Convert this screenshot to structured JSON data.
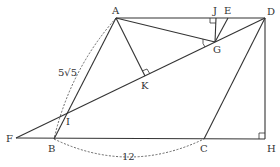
{
  "figure": {
    "type": "geometry",
    "points": {
      "A": {
        "label": "A",
        "x": 116,
        "y": 18
      },
      "D": {
        "label": "D",
        "x": 265,
        "y": 18
      },
      "J": {
        "label": "J",
        "x": 216,
        "y": 18
      },
      "E": {
        "label": "E",
        "x": 228,
        "y": 18
      },
      "G": {
        "label": "G",
        "x": 215,
        "y": 42
      },
      "K": {
        "label": "K",
        "x": 145,
        "y": 76
      },
      "I": {
        "label": "I",
        "x": 64,
        "y": 117
      },
      "F": {
        "label": "F",
        "x": 16,
        "y": 138
      },
      "B": {
        "label": "B",
        "x": 54,
        "y": 139
      },
      "C": {
        "label": "C",
        "x": 204,
        "y": 139
      },
      "H": {
        "label": "H",
        "x": 265,
        "y": 139
      }
    },
    "measurements": {
      "AB": "5√5",
      "BC": "12"
    }
  }
}
